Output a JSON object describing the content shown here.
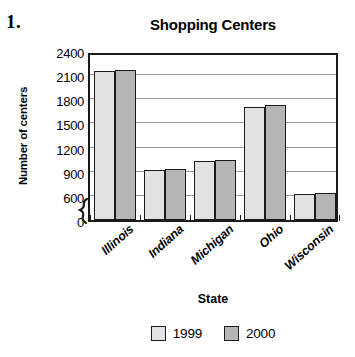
{
  "problem_number": "1.",
  "chart_data": {
    "type": "bar",
    "title": "Shopping Centers",
    "xlabel": "State",
    "ylabel": "Number of centers",
    "categories": [
      "Illinois",
      "Indiana",
      "Michigan",
      "Ohio",
      "Wisconsin"
    ],
    "series": [
      {
        "name": "1999",
        "color": "#e2e2e2",
        "values": [
          2150,
          925,
          1030,
          1710,
          625
        ]
      },
      {
        "name": "2000",
        "color": "#b5b5b5",
        "values": [
          2170,
          930,
          1050,
          1730,
          630
        ]
      }
    ],
    "ylim": [
      0,
      2400
    ],
    "y_ticks": [
      0,
      600,
      900,
      1200,
      1500,
      1800,
      2100,
      2400
    ],
    "y_axis_break": true,
    "y_axis_break_between": [
      0,
      600
    ],
    "grid": true,
    "legend_position": "bottom",
    "x_tick_label_rotation": -42
  }
}
